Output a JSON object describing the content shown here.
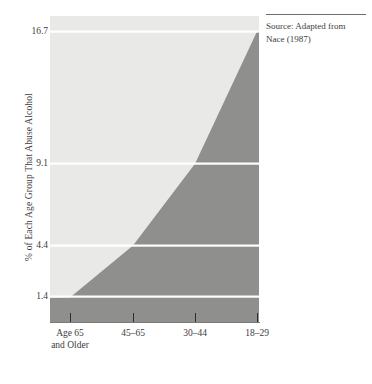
{
  "figure": {
    "source_note": {
      "text": "Source: Adapted from Nace (1987)"
    }
  },
  "chart_data": {
    "type": "area",
    "title": "",
    "subtitle": "",
    "xlabel": "",
    "ylabel": "% of Each Age Group That Abuse Alcohol",
    "categories": [
      "Age 65\nand Older",
      "45–65",
      "30–44",
      "18–29"
    ],
    "categories_plain": [
      "Age 65 and Older",
      "45-65",
      "30-44",
      "18-29"
    ],
    "values": [
      1.4,
      4.4,
      9.1,
      16.7
    ],
    "ytick_labels": [
      "16.7",
      "9.1",
      "4.4",
      "1.4"
    ],
    "ytick_values": [
      16.7,
      9.1,
      4.4,
      1.4
    ],
    "ylim": [
      0,
      16.7
    ],
    "grid": "horizontal-white-lines-at-data-values",
    "legend": "none",
    "colors": {
      "filled_area": "#8f8f8d",
      "background_area": "#e9e9e7",
      "gridline": "#ffffff",
      "axis": "#7a7a78",
      "text": "#3d3d3d"
    },
    "annotations": []
  }
}
